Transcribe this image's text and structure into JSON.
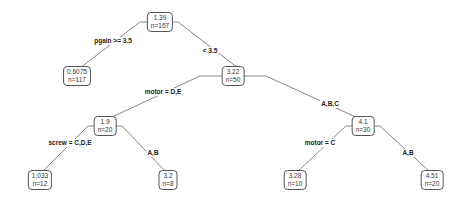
{
  "diagram": {
    "type": "regression-tree",
    "line_color": "#555555",
    "nodes": [
      {
        "id": "root",
        "value": "1.39",
        "n": "n=167",
        "x": 160,
        "y": 22
      },
      {
        "id": "n2",
        "value": "0.6075",
        "n": "n=117",
        "x": 77,
        "y": 76
      },
      {
        "id": "n3",
        "value": "3.22",
        "n": "n=50",
        "x": 233,
        "y": 76
      },
      {
        "id": "n4",
        "value": "1.9",
        "n": "n=20",
        "x": 105,
        "y": 126
      },
      {
        "id": "n5",
        "value": "4.1",
        "n": "n=30",
        "x": 363,
        "y": 126
      },
      {
        "id": "n6",
        "value": "1.033",
        "n": "n=12",
        "x": 40,
        "y": 180
      },
      {
        "id": "n7",
        "value": "3.2",
        "n": "n=8",
        "x": 168,
        "y": 180
      },
      {
        "id": "n8",
        "value": "3.28",
        "n": "n=10",
        "x": 295,
        "y": 180
      },
      {
        "id": "n9",
        "value": "4.51",
        "n": "n=20",
        "x": 432,
        "y": 180
      }
    ],
    "edges": [
      {
        "from": "root",
        "to": "n2",
        "label": "pgain >= 3.5",
        "lx": 113,
        "ly": 41
      },
      {
        "from": "root",
        "to": "n3",
        "label": "< 3.5",
        "lx": 210,
        "ly": 51
      },
      {
        "from": "n3",
        "to": "n4",
        "label": "motor = D,E",
        "lx": 163,
        "ly": 92
      },
      {
        "from": "n3",
        "to": "n5",
        "label": "A,B,C",
        "lx": 330,
        "ly": 104
      },
      {
        "from": "n4",
        "to": "n6",
        "label": "screw = C,D,E",
        "lx": 70,
        "ly": 143
      },
      {
        "from": "n4",
        "to": "n7",
        "label": "A,B",
        "lx": 153,
        "ly": 153
      },
      {
        "from": "n5",
        "to": "n8",
        "label": "motor = C",
        "lx": 320,
        "ly": 143
      },
      {
        "from": "n5",
        "to": "n9",
        "label": "A,B",
        "lx": 408,
        "ly": 153
      }
    ]
  }
}
